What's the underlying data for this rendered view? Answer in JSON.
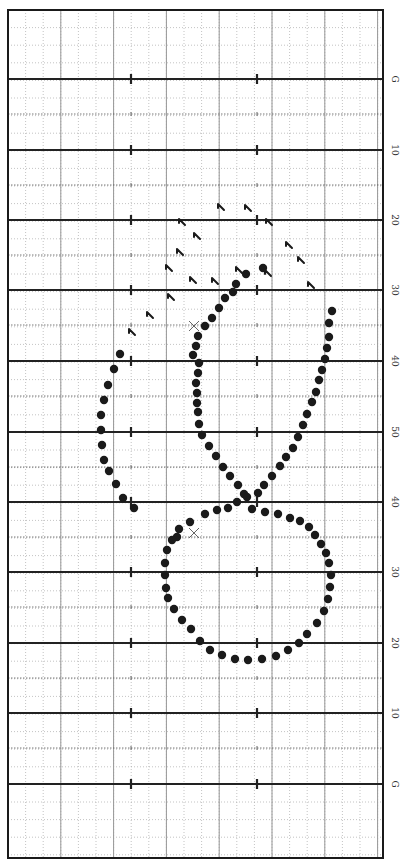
{
  "chart_data": {
    "type": "scatter",
    "title": "",
    "field": {
      "left": 8,
      "right": 383,
      "top": 10,
      "bottom": 858,
      "border_color": "#1a1a1a",
      "minor_spacing": 17.6,
      "hash_x": [
        131,
        257
      ]
    },
    "yard_lines": [
      {
        "y": 79,
        "label": "G"
      },
      {
        "y": 150,
        "label": "10"
      },
      {
        "y": 220,
        "label": "20"
      },
      {
        "y": 290,
        "label": "30"
      },
      {
        "y": 361,
        "label": "40"
      },
      {
        "y": 432,
        "label": "50"
      },
      {
        "y": 502,
        "label": "40"
      },
      {
        "y": 572,
        "label": "30"
      },
      {
        "y": 643,
        "label": "20"
      },
      {
        "y": 713,
        "label": "10"
      },
      {
        "y": 784,
        "label": "G"
      }
    ],
    "five_yard_lines": [
      114,
      185,
      255,
      325,
      396,
      467,
      537,
      607,
      678,
      748
    ],
    "labels_x": 392,
    "dots": [
      [
        263,
        268
      ],
      [
        246,
        274
      ],
      [
        236,
        284
      ],
      [
        233,
        292
      ],
      [
        225,
        298
      ],
      [
        219,
        308
      ],
      [
        212,
        318
      ],
      [
        205,
        326
      ],
      [
        198,
        336
      ],
      [
        196,
        346
      ],
      [
        193,
        355
      ],
      [
        199,
        363
      ],
      [
        198,
        373
      ],
      [
        196,
        383
      ],
      [
        197,
        393
      ],
      [
        197,
        403
      ],
      [
        198,
        412
      ],
      [
        199,
        424
      ],
      [
        202,
        435
      ],
      [
        209,
        446
      ],
      [
        216,
        456
      ],
      [
        223,
        467
      ],
      [
        230,
        476
      ],
      [
        238,
        485
      ],
      [
        244,
        494
      ],
      [
        237,
        502
      ],
      [
        228,
        508
      ],
      [
        217,
        510
      ],
      [
        205,
        514
      ],
      [
        190,
        522
      ],
      [
        179,
        529
      ],
      [
        177,
        537
      ],
      [
        172,
        540
      ],
      [
        167,
        550
      ],
      [
        165,
        563
      ],
      [
        165,
        575
      ],
      [
        166,
        588
      ],
      [
        168,
        598
      ],
      [
        174,
        609
      ],
      [
        182,
        620
      ],
      [
        191,
        629
      ],
      [
        200,
        641
      ],
      [
        210,
        650
      ],
      [
        222,
        655
      ],
      [
        235,
        659
      ],
      [
        248,
        660
      ],
      [
        262,
        659
      ],
      [
        276,
        656
      ],
      [
        288,
        650
      ],
      [
        299,
        643
      ],
      [
        307,
        634
      ],
      [
        317,
        623
      ],
      [
        324,
        611
      ],
      [
        328,
        599
      ],
      [
        330,
        587
      ],
      [
        331,
        575
      ],
      [
        329,
        563
      ],
      [
        326,
        553
      ],
      [
        321,
        544
      ],
      [
        315,
        535
      ],
      [
        309,
        527
      ],
      [
        300,
        521
      ],
      [
        290,
        518
      ],
      [
        278,
        514
      ],
      [
        265,
        512
      ],
      [
        252,
        509
      ],
      [
        247,
        497
      ],
      [
        258,
        493
      ],
      [
        264,
        485
      ],
      [
        272,
        476
      ],
      [
        280,
        466
      ],
      [
        286,
        457
      ],
      [
        293,
        448
      ],
      [
        298,
        437
      ],
      [
        303,
        425
      ],
      [
        307,
        414
      ],
      [
        312,
        402
      ],
      [
        316,
        392
      ],
      [
        319,
        380
      ],
      [
        322,
        370
      ],
      [
        325,
        359
      ],
      [
        327,
        348
      ],
      [
        329,
        337
      ],
      [
        329,
        323
      ],
      [
        332,
        311
      ],
      [
        120,
        354
      ],
      [
        114,
        369
      ],
      [
        108,
        385
      ],
      [
        104,
        400
      ],
      [
        101,
        415
      ],
      [
        101,
        430
      ],
      [
        102,
        445
      ],
      [
        104,
        460
      ],
      [
        109,
        471
      ],
      [
        116,
        484
      ],
      [
        123,
        498
      ],
      [
        134,
        508
      ]
    ],
    "flags": [
      [
        221,
        207
      ],
      [
        248,
        208
      ],
      [
        182,
        222
      ],
      [
        269,
        222
      ],
      [
        197,
        236
      ],
      [
        289,
        245
      ],
      [
        180,
        252
      ],
      [
        301,
        260
      ],
      [
        169,
        268
      ],
      [
        239,
        270
      ],
      [
        268,
        273
      ],
      [
        215,
        281
      ],
      [
        193,
        280
      ],
      [
        311,
        285
      ],
      [
        171,
        297
      ],
      [
        150,
        315
      ],
      [
        132,
        332
      ]
    ],
    "x_marks": [
      [
        194,
        326
      ],
      [
        194,
        533
      ]
    ],
    "colors": {
      "dot": "#1a1a1a",
      "grid_minor": "#9a9a9a",
      "grid_major": "#222222",
      "flag": "#1a1a1a"
    }
  }
}
